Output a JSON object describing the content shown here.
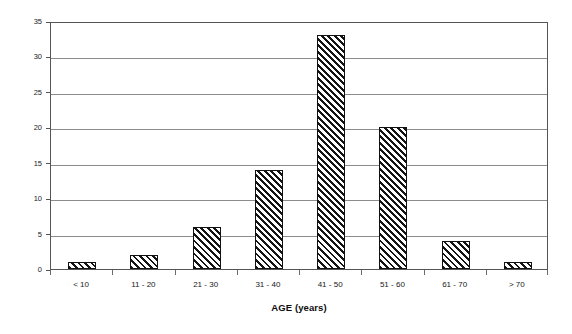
{
  "chart_data": {
    "type": "bar",
    "title": "",
    "xlabel": "AGE (years)",
    "ylabel": "Number of Patients",
    "categories": [
      "< 10",
      "11 - 20",
      "21 - 30",
      "31 - 40",
      "41 - 50",
      "51 - 60",
      "61 - 70",
      "> 70"
    ],
    "values": [
      1,
      2,
      6,
      14,
      33,
      20,
      4,
      1
    ],
    "ylim": [
      0,
      35
    ],
    "yticks": [
      0,
      5,
      10,
      15,
      20,
      25,
      30,
      35
    ],
    "ytick_labels": [
      "0",
      "5",
      "10",
      "15",
      "20",
      "25",
      "30",
      "35"
    ],
    "grid": "horizontal",
    "legend": "none",
    "bar_fill": "diagonal-hatch",
    "bar_edge_color": "#111111",
    "grid_color": "#8c8c8c",
    "frame_color": "#555555",
    "background": "#ffffff"
  }
}
